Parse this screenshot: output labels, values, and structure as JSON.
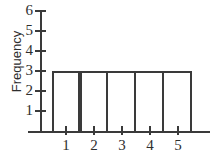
{
  "chart_data": {
    "type": "bar",
    "title": "",
    "xlabel": "",
    "ylabel": "Frequency",
    "categories": [
      "1",
      "2",
      "3",
      "4",
      "5"
    ],
    "values": [
      3,
      3,
      3,
      3,
      3
    ],
    "ylim": [
      0,
      6
    ],
    "yticks": [
      1,
      2,
      3,
      4,
      5,
      6
    ],
    "ytick_labels": [
      "1",
      "2",
      "3",
      "4",
      "5",
      "6"
    ],
    "xticks": [
      1,
      2,
      3,
      4,
      5
    ],
    "xtick_labels": [
      "1",
      "2",
      "3",
      "4",
      "5"
    ],
    "grid": false,
    "legend": null,
    "bar_style": "outlined-unfilled-adjacent",
    "colors": {
      "line": "#3a3a3a",
      "background": "#ffffff",
      "text": "#2e2e2e"
    }
  }
}
